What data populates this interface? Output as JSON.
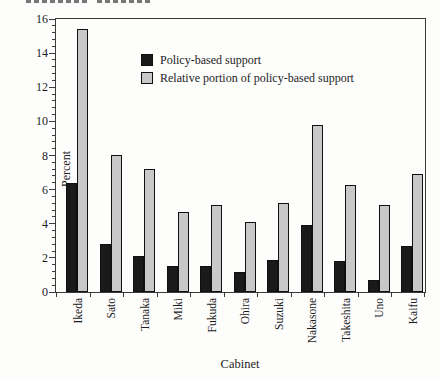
{
  "figure": {
    "y_axis_title": "Percent",
    "x_axis_title": "Cabinet"
  },
  "chart_data": {
    "type": "bar",
    "title": "",
    "categories": [
      "Ikeda",
      "Sato",
      "Tanaka",
      "Miki",
      "Fukuda",
      "Ohira",
      "Suzuki",
      "Nakasone",
      "Takeshita",
      "Uno",
      "Kaifu"
    ],
    "series": [
      {
        "name": "Policy-based support",
        "color": "#1a1a1a",
        "values": [
          6.4,
          2.8,
          2.1,
          1.5,
          1.5,
          1.2,
          1.9,
          3.9,
          1.8,
          0.7,
          2.7
        ]
      },
      {
        "name": "Relative portion of policy-based support",
        "color": "#c8c8c8",
        "values": [
          15.4,
          8.0,
          7.2,
          4.7,
          5.1,
          4.1,
          5.2,
          9.8,
          6.3,
          5.1,
          6.9
        ]
      }
    ],
    "xlabel": "Cabinet",
    "ylabel": "Percent",
    "ylim": [
      0,
      16
    ],
    "y_major_step": 2,
    "y_minor_step": 0.4,
    "grid": false,
    "legend_position": "upper-center-inside",
    "bar_outline_color": "#101010",
    "frame": true
  }
}
